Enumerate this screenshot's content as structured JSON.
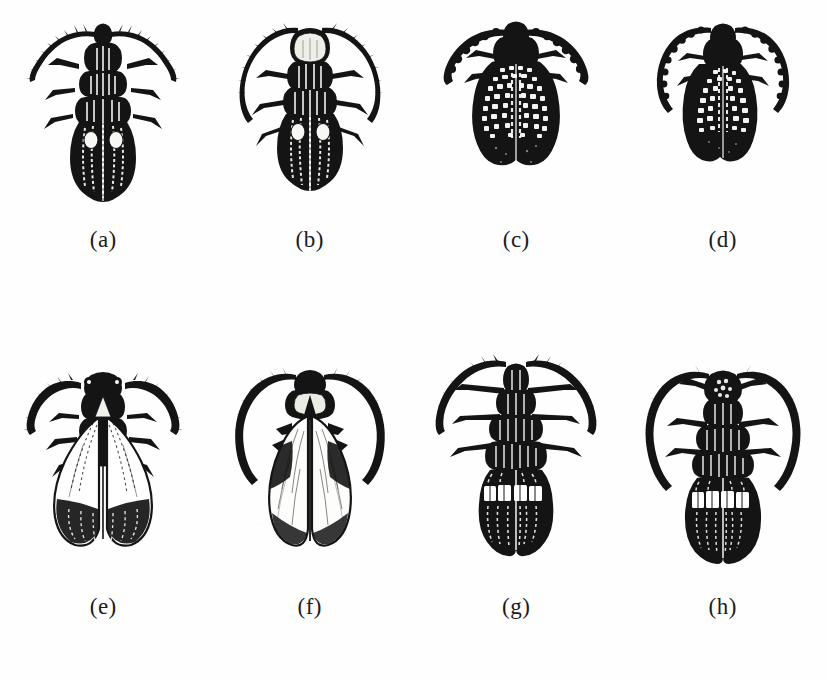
{
  "plate": {
    "background_color": "#fefefe",
    "ink_color": "#1a1a1a",
    "columns": 4,
    "rows": 2
  },
  "specimens": [
    {
      "caption": "(a)",
      "id": "specimen-a",
      "body_form": "elongate-parallel",
      "antenna_type": "serrate-straight",
      "elytra_pattern": "longitudinal-ribbed-dark",
      "markings": "two pale oval spots",
      "color": "#141414"
    },
    {
      "caption": "(b)",
      "id": "specimen-b",
      "body_form": "elongate-oval",
      "antenna_type": "long-curved-filiform",
      "elytra_pattern": "longitudinal-ribbed-dark",
      "markings": "two pale oval spots, pale rounded pronotum",
      "color": "#141414"
    },
    {
      "caption": "(c)",
      "id": "specimen-c",
      "body_form": "broad-rounded",
      "antenna_type": "short-thick-curved",
      "elytra_pattern": "reticulate-checkered",
      "markings": "dark apical third",
      "color": "#141414"
    },
    {
      "caption": "(d)",
      "id": "specimen-d",
      "body_form": "narrow-oval",
      "antenna_type": "long-sweeping-curved",
      "elytra_pattern": "reticulate-checkered",
      "markings": "dark apical half",
      "color": "#141414"
    },
    {
      "caption": "(e)",
      "id": "specimen-e",
      "body_form": "flared-spatulate",
      "antenna_type": "long-segmented-lateral",
      "elytra_pattern": "pale-base-dark-apex",
      "markings": "broad pale elytral base",
      "color": "#141414"
    },
    {
      "caption": "(f)",
      "id": "specimen-f",
      "body_form": "broadly-flared",
      "antenna_type": "long-arching",
      "elytra_pattern": "pale-hatched",
      "markings": "dark shoulder patches",
      "color": "#141414"
    },
    {
      "caption": "(g)",
      "id": "specimen-g",
      "body_form": "elongate-robust",
      "antenna_type": "long-curved-segmented",
      "elytra_pattern": "dark-with-transverse-band",
      "markings": "white transverse band",
      "color": "#141414"
    },
    {
      "caption": "(h)",
      "id": "specimen-h",
      "body_form": "oval-robust",
      "antenna_type": "very-long-arching",
      "elytra_pattern": "dark-with-transverse-band",
      "markings": "white transverse band, pale head",
      "color": "#141414"
    }
  ]
}
